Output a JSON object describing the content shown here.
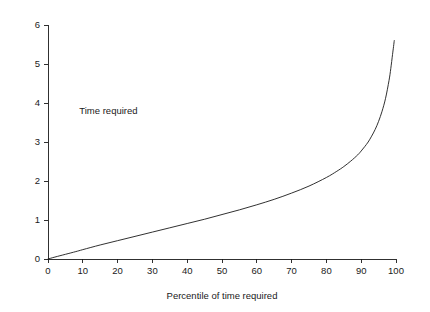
{
  "chart_data": {
    "type": "line",
    "title": "",
    "subtitle": "",
    "xlabel": "Percentile of time required",
    "ylabel": "",
    "xlim": [
      0,
      100
    ],
    "ylim": [
      0,
      6
    ],
    "grid": false,
    "legend": null,
    "legend_position": "none",
    "x_ticks": [
      0,
      10,
      20,
      30,
      40,
      50,
      60,
      70,
      80,
      90,
      100
    ],
    "x_tick_labels": [
      "0",
      "10",
      "20",
      "30",
      "40",
      "50",
      "60",
      "70",
      "80",
      "90",
      "100"
    ],
    "y_ticks": [
      0,
      1,
      2,
      3,
      4,
      5,
      6
    ],
    "y_tick_labels": [
      "0",
      "1",
      "2",
      "3",
      "4",
      "5",
      "6"
    ],
    "annotations": [
      {
        "text": "Time required",
        "x": 9,
        "y": 3.72
      }
    ],
    "series": [
      {
        "name": "Time required",
        "color": "#1a1a1a",
        "x": [
          0,
          2,
          5,
          8,
          10,
          15,
          20,
          25,
          30,
          35,
          40,
          45,
          50,
          55,
          60,
          65,
          70,
          75,
          80,
          83,
          85,
          87,
          89,
          90,
          91,
          92,
          93,
          94,
          95,
          96,
          97,
          98,
          98.5,
          99,
          99.3,
          99.5
        ],
        "y": [
          0.0,
          0.05,
          0.12,
          0.19,
          0.24,
          0.36,
          0.47,
          0.58,
          0.69,
          0.8,
          0.91,
          1.02,
          1.14,
          1.26,
          1.39,
          1.53,
          1.69,
          1.87,
          2.09,
          2.25,
          2.37,
          2.51,
          2.67,
          2.77,
          2.88,
          3.0,
          3.15,
          3.32,
          3.53,
          3.79,
          4.12,
          4.58,
          4.88,
          5.24,
          5.45,
          5.6
        ]
      }
    ]
  },
  "geometry": {
    "plot_left": 48,
    "plot_right": 396,
    "plot_bottom": 259,
    "plot_top": 25,
    "tick_len": 4
  }
}
